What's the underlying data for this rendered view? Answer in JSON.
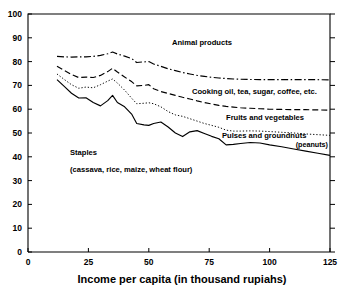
{
  "figure": {
    "clipped_top_title": "",
    "background": "#ffffff",
    "ink_color": "#000000"
  },
  "chart_data": {
    "type": "line",
    "title": "",
    "xlabel": "Income per capita (in thousand rupiahs)",
    "ylabel": "",
    "xlim": [
      0,
      125
    ],
    "ylim": [
      0,
      100
    ],
    "xticks": [
      0,
      25,
      50,
      75,
      100,
      125
    ],
    "yticks": [
      0,
      10,
      20,
      30,
      40,
      50,
      60,
      70,
      80,
      90,
      100
    ],
    "grid": false,
    "legend": "inline-annotations",
    "x": [
      12,
      15,
      18,
      21,
      24,
      27,
      30,
      33,
      35,
      37,
      40,
      43,
      45,
      48,
      50,
      52,
      55,
      58,
      61,
      64,
      67,
      70,
      73,
      76,
      79,
      82,
      85,
      88,
      92,
      96,
      100,
      105,
      110,
      115,
      120,
      125
    ],
    "series": [
      {
        "name": "Animal products",
        "label": "Animal products",
        "style": "dashdot",
        "values": [
          82.2,
          82.0,
          81.9,
          82.0,
          82.0,
          82.2,
          82.6,
          83.3,
          84.0,
          83.2,
          82.3,
          81.2,
          79.6,
          79.9,
          80.0,
          79.0,
          78.0,
          77.0,
          76.2,
          75.4,
          74.8,
          74.2,
          73.8,
          73.4,
          73.1,
          72.9,
          72.7,
          72.6,
          72.5,
          72.4,
          72.4,
          72.4,
          72.4,
          72.4,
          72.4,
          72.3
        ]
      },
      {
        "name": "Cooking oil, tea, sugar, coffee, etc.",
        "label": "Cooking oil, tea, sugar, coffee, etc.",
        "style": "dashed",
        "values": [
          78.0,
          76.3,
          74.6,
          73.3,
          73.5,
          73.3,
          74.2,
          75.8,
          77.2,
          75.6,
          73.5,
          71.5,
          69.8,
          70.0,
          70.3,
          68.6,
          67.4,
          66.6,
          65.8,
          65.0,
          64.3,
          63.5,
          62.8,
          62.2,
          61.6,
          61.2,
          60.9,
          60.6,
          60.4,
          60.2,
          60.0,
          59.9,
          59.8,
          59.8,
          59.7,
          59.6
        ]
      },
      {
        "name": "Fruits and vegetables",
        "label": "Fruits and vegetables",
        "style": "dotted",
        "values": [
          74.8,
          72.5,
          70.3,
          68.8,
          69.3,
          69.0,
          70.3,
          71.8,
          72.7,
          71.0,
          68.0,
          64.5,
          62.3,
          62.5,
          62.7,
          62.3,
          61.0,
          59.0,
          57.6,
          57.0,
          56.0,
          55.0,
          54.0,
          53.2,
          52.4,
          51.2,
          50.8,
          50.8,
          50.9,
          50.8,
          50.6,
          50.3,
          50.0,
          49.6,
          49.3,
          49.0
        ]
      },
      {
        "name": "Pulses and groundnuts (peanuts)",
        "label": "Pulses and groundnuts",
        "sublabel": "(peanuts)",
        "style": "solid",
        "values": [
          72.4,
          69.6,
          66.7,
          64.7,
          64.8,
          62.8,
          61.4,
          63.6,
          65.8,
          62.8,
          61.0,
          57.8,
          54.0,
          53.4,
          53.2,
          54.0,
          54.6,
          52.5,
          50.0,
          48.5,
          50.5,
          51.0,
          49.8,
          48.6,
          47.6,
          45.0,
          45.2,
          45.6,
          46.0,
          45.8,
          45.0,
          44.2,
          43.3,
          42.4,
          41.5,
          40.6
        ]
      }
    ],
    "annotations": [
      {
        "name": "animal-products-label",
        "text": "Animal products"
      },
      {
        "name": "cooking-oil-label",
        "text": "Cooking oil, tea, sugar, coffee, etc."
      },
      {
        "name": "fruits-vegetables-label",
        "text": "Fruits and vegetables"
      },
      {
        "name": "pulses-groundnuts-label",
        "text": "Pulses and groundnuts"
      },
      {
        "name": "pulses-groundnuts-sublabel",
        "text": "(peanuts)"
      },
      {
        "name": "staples-label",
        "text": "Staples"
      },
      {
        "name": "staples-sublabel",
        "text": "(cassava, rice, maize, wheat flour)"
      }
    ]
  },
  "axis": {
    "x_title": "Income per capita (in thousand rupiahs)",
    "xtick_labels": [
      "0",
      "25",
      "50",
      "75",
      "100",
      "125"
    ],
    "ytick_labels": [
      "0",
      "10",
      "20",
      "30",
      "40",
      "50",
      "60",
      "70",
      "80",
      "90",
      "100"
    ]
  },
  "labels": {
    "animal_products": "Animal products",
    "cooking_oil": "Cooking oil, tea, sugar, coffee, etc.",
    "fruits_vegetables": "Fruits and vegetables",
    "pulses_groundnuts": "Pulses and groundnuts",
    "peanuts": "(peanuts)",
    "staples": "Staples",
    "staples_detail": "(cassava, rice, maize, wheat flour)"
  }
}
